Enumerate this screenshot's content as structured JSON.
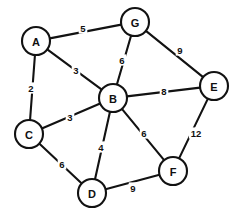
{
  "chart_data": {
    "type": "diagram",
    "diagram_kind": "undirected-weighted-graph",
    "title": "",
    "background_color": "#ffffff",
    "stroke_color": "#121212",
    "node_fill": "#ffffff",
    "node_radius": 14,
    "canvas": {
      "width": 237,
      "height": 221
    },
    "nodes": [
      {
        "id": "A",
        "label": "A",
        "x": 36,
        "y": 41
      },
      {
        "id": "B",
        "label": "B",
        "x": 113,
        "y": 98
      },
      {
        "id": "C",
        "label": "C",
        "x": 29,
        "y": 134
      },
      {
        "id": "D",
        "label": "D",
        "x": 92,
        "y": 193
      },
      {
        "id": "E",
        "label": "E",
        "x": 214,
        "y": 86
      },
      {
        "id": "F",
        "label": "F",
        "x": 173,
        "y": 171
      },
      {
        "id": "G",
        "label": "G",
        "x": 135,
        "y": 22
      }
    ],
    "edges": [
      {
        "source": "A",
        "target": "G",
        "weight": 5,
        "label": "5",
        "lx": 83,
        "ly": 28
      },
      {
        "source": "A",
        "target": "C",
        "weight": 2,
        "label": "2",
        "lx": 31,
        "ly": 88
      },
      {
        "source": "A",
        "target": "B",
        "weight": 3,
        "label": "3",
        "lx": 76,
        "ly": 70
      },
      {
        "source": "G",
        "target": "B",
        "weight": 6,
        "label": "6",
        "lx": 122,
        "ly": 60
      },
      {
        "source": "G",
        "target": "E",
        "weight": 9,
        "label": "9",
        "lx": 180,
        "ly": 50
      },
      {
        "source": "B",
        "target": "E",
        "weight": 8,
        "label": "8",
        "lx": 164,
        "ly": 91
      },
      {
        "source": "B",
        "target": "C",
        "weight": 3,
        "label": "3",
        "lx": 70,
        "ly": 117
      },
      {
        "source": "B",
        "target": "D",
        "weight": 4,
        "label": "4",
        "lx": 101,
        "ly": 147
      },
      {
        "source": "B",
        "target": "F",
        "weight": 6,
        "label": "6",
        "lx": 144,
        "ly": 133
      },
      {
        "source": "C",
        "target": "D",
        "weight": 6,
        "label": "6",
        "lx": 62,
        "ly": 164
      },
      {
        "source": "D",
        "target": "F",
        "weight": 9,
        "label": "9",
        "lx": 133,
        "ly": 188
      },
      {
        "source": "E",
        "target": "F",
        "weight": 12,
        "label": "12",
        "lx": 196,
        "ly": 133
      }
    ],
    "node_count": 7,
    "edge_count": 12,
    "xlabel": "",
    "ylabel": "",
    "legend": []
  }
}
